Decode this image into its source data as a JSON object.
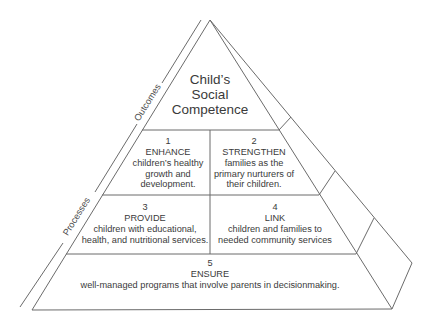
{
  "diagram": {
    "type": "pyramid",
    "side_labels": {
      "outcomes": "Outcomes",
      "processes": "Processes"
    },
    "apex": {
      "title_lines": [
        "Child’s",
        "Social",
        "Competence"
      ]
    },
    "blocks": [
      {
        "number": "1",
        "verb": "ENHANCE",
        "lines": [
          "children’s healthy",
          "growth and",
          "development."
        ]
      },
      {
        "number": "2",
        "verb": "STRENGTHEN",
        "lines": [
          "families as the",
          "primary nurturers of",
          "their children."
        ]
      },
      {
        "number": "3",
        "verb": "PROVIDE",
        "lines": [
          "children with educational,",
          "health, and nutritional services."
        ]
      },
      {
        "number": "4",
        "verb": "LINK",
        "lines": [
          "children and families to",
          "needed community services"
        ]
      },
      {
        "number": "5",
        "verb": "ENSURE",
        "lines": [
          "well-managed programs that involve parents in decisionmaking."
        ]
      }
    ],
    "colors": {
      "line": "#6b6b6b",
      "text": "#3a3a3a",
      "background": "#ffffff"
    }
  }
}
